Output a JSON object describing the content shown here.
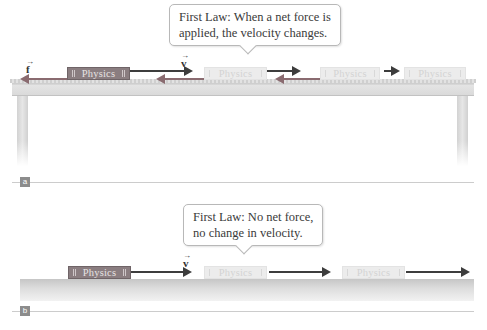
{
  "panel_a": {
    "label": "a",
    "callout": {
      "line1": "First Law: When a net force is",
      "line2": "applied, the velocity changes."
    },
    "vectors": {
      "friction": "f",
      "velocity": "v",
      "overarrow": "→"
    },
    "books": [
      {
        "title": "Physics",
        "style": "solid"
      },
      {
        "title": "Physics",
        "style": "ghost"
      },
      {
        "title": "Physics",
        "style": "ghost"
      },
      {
        "title": "Physics",
        "style": "ghost"
      }
    ]
  },
  "panel_b": {
    "label": "b",
    "callout": {
      "line1": "First Law: No net force,",
      "line2": "no change in velocity."
    },
    "vectors": {
      "velocity": "v",
      "overarrow": "→"
    },
    "books": [
      {
        "title": "Physics",
        "style": "solid"
      },
      {
        "title": "Physics",
        "style": "ghost"
      },
      {
        "title": "Physics",
        "style": "ghost"
      }
    ]
  },
  "colors": {
    "book_solid": "#8a7d80",
    "book_ghost": "#ececec",
    "velocity_arrow": "#3d3d3d",
    "friction_arrow": "#8a6b70",
    "table": "#dadada",
    "panel_label_bg": "#8c8c8c"
  }
}
